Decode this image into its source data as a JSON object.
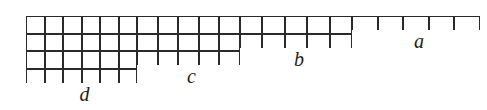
{
  "figure": {
    "type": "grid-diagram",
    "width": 487,
    "height": 110,
    "background_color": "#ffffff",
    "line_color": "#2a2a2a",
    "dot_color": "#1c1c1c",
    "cell_width": 22,
    "cell_height": 17.5,
    "grid_origin": {
      "x": 26,
      "y": 16
    },
    "ellipsis_glyph": "· · ·",
    "dots_per_ellipsis_cell": 3
  },
  "segments": [
    {
      "id": "d",
      "label": "d",
      "rows": 4,
      "columns": 6,
      "ellipsis_column_index": 3,
      "x": 26,
      "width": 111,
      "measure": {
        "x": 26,
        "y": 86,
        "width": 111,
        "label": "d"
      }
    },
    {
      "id": "c",
      "label": "c",
      "rows": 3,
      "columns": 5,
      "ellipsis_column_index": 3,
      "x": 137,
      "width": 103,
      "measure": {
        "x": 137,
        "y": 68,
        "width": 103,
        "label": "c"
      }
    },
    {
      "id": "b",
      "label": "b",
      "rows": 2,
      "columns": 5,
      "ellipsis_column_index": 3,
      "x": 240,
      "width": 112,
      "measure": {
        "x": 240,
        "y": 51,
        "width": 112,
        "label": "b"
      }
    },
    {
      "id": "a",
      "label": "a",
      "rows": 1,
      "columns": 5,
      "ellipsis_column_index": 3,
      "x": 352,
      "width": 128,
      "measure": {
        "x": 352,
        "y": 33,
        "width": 128,
        "label": "a"
      }
    }
  ],
  "labels": {
    "a": "a",
    "b": "b",
    "c": "c",
    "d": "d"
  }
}
